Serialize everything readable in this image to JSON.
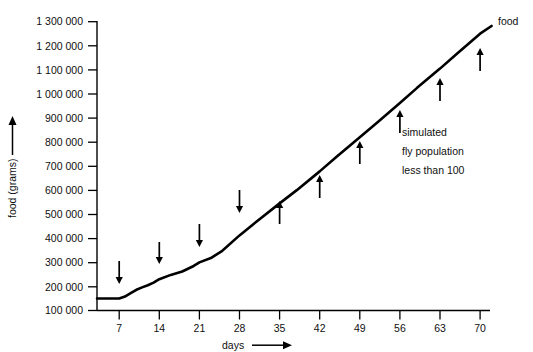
{
  "chart_data": {
    "type": "line",
    "title": "",
    "xlabel": "days",
    "ylabel": "food (grams)",
    "xlim": [
      0,
      73
    ],
    "ylim": [
      100000,
      1300000
    ],
    "grid": false,
    "legend_position": "end-of-line",
    "x_tick_labels": [
      "7",
      "14",
      "21",
      "28",
      "35",
      "42",
      "49",
      "56",
      "63",
      "70"
    ],
    "x_tick_values": [
      7,
      14,
      21,
      28,
      35,
      42,
      49,
      56,
      63,
      70
    ],
    "y_tick_labels": [
      "1 300 000",
      "1 200 000",
      "1 100 000",
      "1 000 000",
      "900 000",
      "800 000",
      "700 000",
      "600 000",
      "500 000",
      "400 000",
      "300 000",
      "200 000",
      "100 000"
    ],
    "y_tick_values": [
      1300000,
      1200000,
      1100000,
      1000000,
      900000,
      800000,
      700000,
      600000,
      500000,
      400000,
      300000,
      200000,
      100000
    ],
    "series": [
      {
        "name": "food",
        "label": "food",
        "color": "#000000",
        "x": [
          0,
          3,
          5,
          7,
          8,
          9,
          10,
          11,
          12,
          13,
          14,
          16,
          18,
          20,
          21,
          23,
          25,
          28,
          31,
          35,
          38,
          42,
          45,
          49,
          52,
          56,
          59,
          63,
          66,
          70,
          72
        ],
        "y": [
          150000,
          150000,
          150000,
          150000,
          158000,
          172000,
          186000,
          196000,
          205000,
          216000,
          230000,
          248000,
          262000,
          285000,
          300000,
          318000,
          348000,
          412000,
          470000,
          545000,
          600000,
          678000,
          740000,
          820000,
          880000,
          962000,
          1025000,
          1105000,
          1168000,
          1250000,
          1282000
        ]
      }
    ],
    "annotations": [
      {
        "name": "arrow-day-7",
        "x": 7,
        "y_top": 261,
        "y_bottom": 284,
        "direction": "down"
      },
      {
        "name": "arrow-day-14",
        "x": 14,
        "y_top": 242,
        "y_bottom": 264,
        "direction": "down"
      },
      {
        "name": "arrow-day-21",
        "x": 21,
        "y_top": 224,
        "y_bottom": 247,
        "direction": "down"
      },
      {
        "name": "arrow-day-28",
        "x": 28,
        "y_top": 190,
        "y_bottom": 213,
        "direction": "down"
      },
      {
        "name": "arrow-day-35",
        "x": 35,
        "y_top": 201,
        "y_bottom": 224,
        "direction": "up"
      },
      {
        "name": "arrow-day-42",
        "x": 42,
        "y_top": 175,
        "y_bottom": 198,
        "direction": "up"
      },
      {
        "name": "arrow-day-49",
        "x": 49,
        "y_top": 141,
        "y_bottom": 164,
        "direction": "up"
      },
      {
        "name": "arrow-day-56",
        "x": 56,
        "y_top": 110,
        "y_bottom": 133,
        "direction": "up"
      },
      {
        "name": "arrow-day-63",
        "x": 63,
        "y_top": 78,
        "y_bottom": 101,
        "direction": "up"
      },
      {
        "name": "arrow-day-70",
        "x": 70,
        "y_top": 48,
        "y_bottom": 71,
        "direction": "up"
      }
    ],
    "text_annotation": {
      "line1": "simulated",
      "line2": "fly population",
      "line3": "less than 100"
    }
  }
}
